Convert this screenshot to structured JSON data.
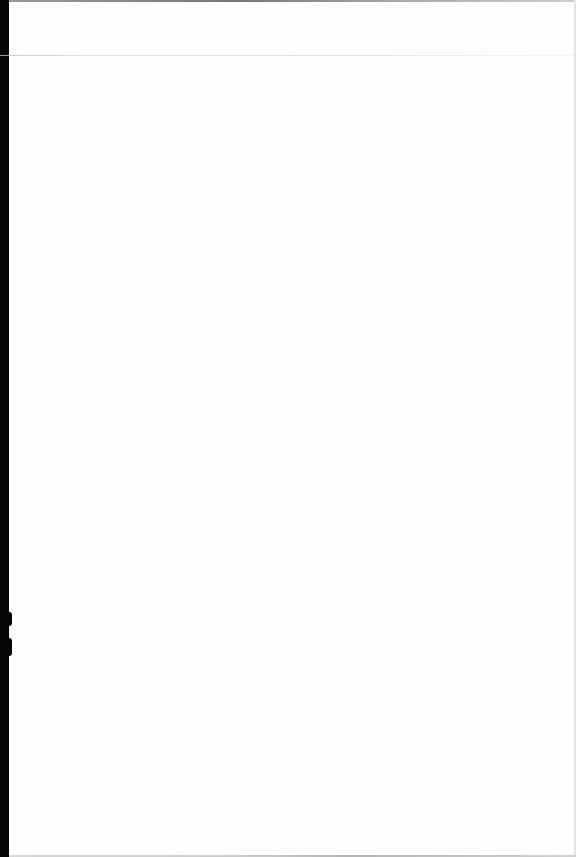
{
  "document": {
    "type": "scanned-page",
    "content_text": "",
    "background_color": "#fefefe",
    "scan_margin_color": "#050505"
  }
}
